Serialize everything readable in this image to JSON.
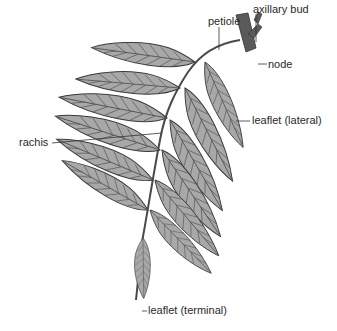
{
  "diagram": {
    "colors": {
      "leaf_fill": "#a8a8a8",
      "leaf_stroke": "#3a3a3a",
      "vein": "#4a4a4a",
      "stem": "#5a5a5a",
      "leader": "#333333",
      "text": "#2a2a2a"
    },
    "labels": {
      "petiole": "petiole",
      "axillary_bud": "axillary bud",
      "node": "node",
      "leaflet_lateral": "leaflet (lateral)",
      "rachis": "rachis",
      "leaflet_terminal": "leaflet (terminal)"
    }
  }
}
